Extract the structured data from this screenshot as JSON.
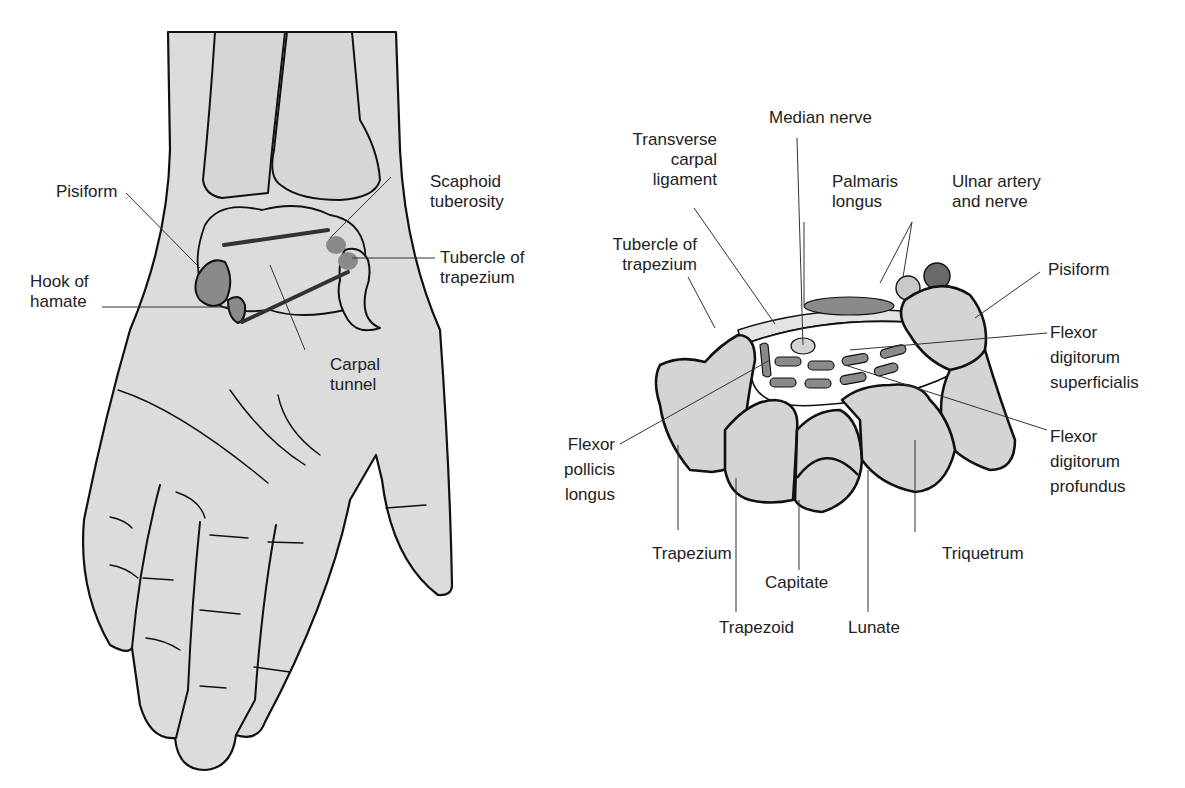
{
  "left_figure": {
    "name": "Palmar view of hand and wrist",
    "labels": {
      "scaphoid_tuberosity": [
        "Scaphoid",
        "tuberosity"
      ],
      "pisiform": [
        "Pisiform"
      ],
      "tubercle_of_trapezium": [
        "Tubercle of",
        "trapezium"
      ],
      "hook_of_hamate": [
        "Hook of",
        "hamate"
      ],
      "carpal_tunnel": [
        "Carpal",
        "tunnel"
      ]
    }
  },
  "right_figure": {
    "name": "Cross-section of carpal tunnel",
    "labels": {
      "median_nerve": [
        "Median nerve"
      ],
      "transverse_carpal_ligament": [
        "Transverse",
        "carpal",
        "ligament"
      ],
      "palmaris_longus": [
        "Palmaris",
        "longus"
      ],
      "ulnar_artery_nerve": [
        "Ulnar artery",
        "and nerve"
      ],
      "tubercle_of_trapezium": [
        "Tubercle of",
        "trapezium"
      ],
      "pisiform": [
        "Pisiform"
      ],
      "fds": [
        "Flexor",
        "digitorum",
        "superficialis"
      ],
      "fpl": [
        "Flexor",
        "pollicis",
        "longus"
      ],
      "fdp": [
        "Flexor",
        "digitorum",
        "profundus"
      ],
      "trapezium": [
        "Trapezium"
      ],
      "triquetrum": [
        "Triquetrum"
      ],
      "capitate": [
        "Capitate"
      ],
      "trapezoid": [
        "Trapezoid"
      ],
      "lunate": [
        "Lunate"
      ]
    }
  },
  "colors": {
    "fill_light": "#dcdcdc",
    "fill_mid": "#8a8a8a",
    "fill_dark": "#666666",
    "outline": "#111111"
  }
}
